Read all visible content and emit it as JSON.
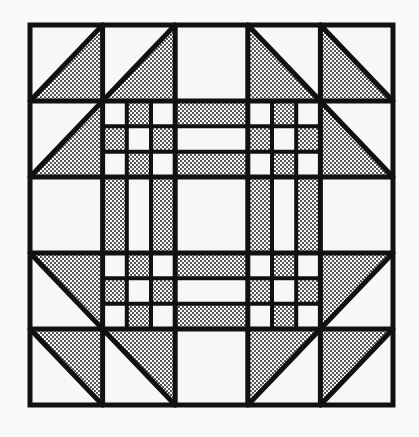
{
  "diagram": {
    "title": "",
    "kind": "quilt-block",
    "grid": {
      "rows": 5,
      "cols": 5
    },
    "box": {
      "x": 30,
      "y": 25,
      "width": 363,
      "height": 380
    },
    "colors": {
      "background": "#fafafa",
      "line": "#111111",
      "fabric_light": "#f7f7f7",
      "stipple_dot": "#111111"
    },
    "triangle_cells": [
      {
        "row": 0,
        "col": 0,
        "diagonal": "bl-tr",
        "shaded": "lower-right"
      },
      {
        "row": 0,
        "col": 1,
        "diagonal": "bl-tr",
        "shaded": "lower-right"
      },
      {
        "row": 1,
        "col": 0,
        "diagonal": "bl-tr",
        "shaded": "lower-right"
      },
      {
        "row": 0,
        "col": 3,
        "diagonal": "tl-br",
        "shaded": "lower-left"
      },
      {
        "row": 0,
        "col": 4,
        "diagonal": "tl-br",
        "shaded": "lower-left"
      },
      {
        "row": 1,
        "col": 4,
        "diagonal": "tl-br",
        "shaded": "lower-left"
      },
      {
        "row": 3,
        "col": 0,
        "diagonal": "tl-br",
        "shaded": "upper-right"
      },
      {
        "row": 4,
        "col": 0,
        "diagonal": "tl-br",
        "shaded": "upper-right"
      },
      {
        "row": 4,
        "col": 1,
        "diagonal": "tl-br",
        "shaded": "upper-right"
      },
      {
        "row": 3,
        "col": 4,
        "diagonal": "bl-tr",
        "shaded": "upper-left"
      },
      {
        "row": 4,
        "col": 3,
        "diagonal": "bl-tr",
        "shaded": "upper-left"
      },
      {
        "row": 4,
        "col": 4,
        "diagonal": "bl-tr",
        "shaded": "upper-left"
      }
    ],
    "plain_cells": [
      {
        "row": 0,
        "col": 2
      },
      {
        "row": 2,
        "col": 0
      },
      {
        "row": 2,
        "col": 4
      },
      {
        "row": 4,
        "col": 2
      },
      {
        "row": 2,
        "col": 2
      }
    ],
    "nine_patch_cells": [
      {
        "row": 1,
        "col": 1
      },
      {
        "row": 1,
        "col": 3
      },
      {
        "row": 3,
        "col": 1
      },
      {
        "row": 3,
        "col": 3
      }
    ],
    "nine_patch_shaded_subcells": [
      [
        0,
        1
      ],
      [
        1,
        0
      ],
      [
        1,
        2
      ],
      [
        2,
        1
      ]
    ],
    "strip_cells": [
      {
        "row": 1,
        "col": 2,
        "orientation": "horizontal",
        "pattern": [
          "shaded",
          "light",
          "shaded"
        ]
      },
      {
        "row": 3,
        "col": 2,
        "orientation": "horizontal",
        "pattern": [
          "shaded",
          "light",
          "shaded"
        ]
      },
      {
        "row": 2,
        "col": 1,
        "orientation": "vertical",
        "pattern": [
          "shaded",
          "light",
          "shaded"
        ]
      },
      {
        "row": 2,
        "col": 3,
        "orientation": "vertical",
        "pattern": [
          "shaded",
          "light",
          "shaded"
        ]
      }
    ]
  }
}
